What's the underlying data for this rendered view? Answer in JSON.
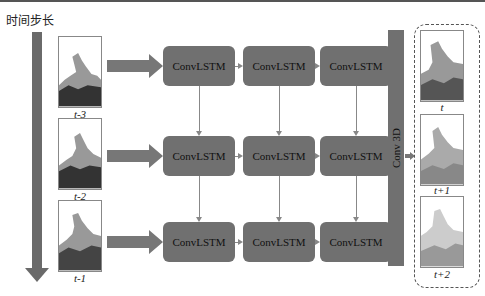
{
  "title": "时间步长",
  "inputs": [
    {
      "label": "t-3"
    },
    {
      "label": "t-2"
    },
    {
      "label": "t-1"
    }
  ],
  "grid": {
    "rows": [
      [
        "ConvLSTM",
        "ConvLSTM",
        "ConvLSTM"
      ],
      [
        "ConvLSTM",
        "ConvLSTM",
        "ConvLSTM"
      ],
      [
        "ConvLSTM",
        "ConvLSTM",
        "ConvLSTM"
      ]
    ]
  },
  "conv3d_label": "Conv 3D",
  "outputs": [
    {
      "label": "t"
    },
    {
      "label": "t+1"
    },
    {
      "label": "t+2"
    }
  ],
  "colors": {
    "block": "#707070",
    "arrow": "#6a6a6a",
    "line": "#888888"
  }
}
